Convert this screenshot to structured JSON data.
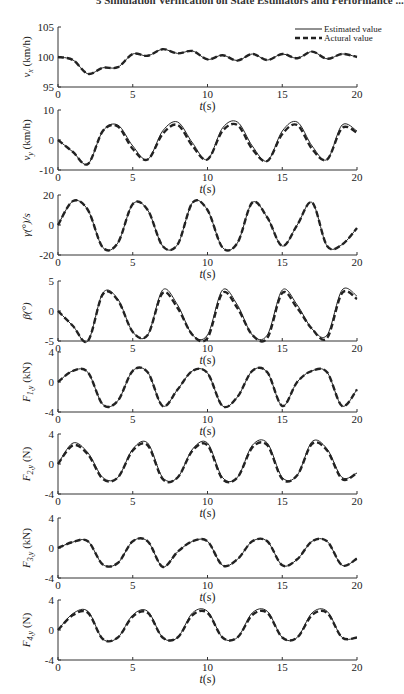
{
  "header": "5   Simulation Verification on State Estimators and Performance ...",
  "legend": [
    {
      "label": "Estimated value",
      "style": "solid"
    },
    {
      "label": "Actural value",
      "style": "dashed"
    }
  ],
  "chart_data": [
    {
      "type": "line",
      "title": "",
      "xlabel": "t(s)",
      "ylabel": "v_x (km/h)",
      "xlim": [
        0,
        20
      ],
      "ylim": [
        95,
        105
      ],
      "yticks": [
        95,
        100,
        105
      ],
      "xticks": [
        0,
        5,
        10,
        15,
        20
      ],
      "x": [
        0,
        1,
        2,
        3,
        4,
        5,
        6,
        7,
        8,
        9,
        10,
        11,
        12,
        13,
        14,
        15,
        16,
        17,
        18,
        19,
        20
      ],
      "series": [
        {
          "name": "Estimated value",
          "values": [
            100,
            99.5,
            97.2,
            98.2,
            98.3,
            100.5,
            100.2,
            101.3,
            100.6,
            101.0,
            99.6,
            100.3,
            99.4,
            100.5,
            99.5,
            100.5,
            99.8,
            100.9,
            99.7,
            100.5,
            100
          ]
        },
        {
          "name": "Actural value",
          "values": [
            100,
            99.5,
            97.2,
            98.2,
            98.3,
            100.5,
            100.2,
            101.3,
            100.6,
            101.0,
            99.6,
            100.3,
            99.4,
            100.5,
            99.5,
            100.5,
            99.8,
            100.9,
            99.7,
            100.5,
            100
          ]
        }
      ]
    },
    {
      "type": "line",
      "xlabel": "t(s)",
      "ylabel": "v_y (km/h)",
      "xlim": [
        0,
        20
      ],
      "ylim": [
        -10,
        10
      ],
      "yticks": [
        -10,
        0,
        10
      ],
      "xticks": [
        0,
        5,
        10,
        15,
        20
      ],
      "x": [
        0,
        1,
        2,
        3,
        4,
        5,
        6,
        7,
        8,
        9,
        10,
        11,
        12,
        13,
        14,
        15,
        16,
        17,
        18,
        19,
        20
      ],
      "series": [
        {
          "name": "Estimated value",
          "values": [
            0,
            -4,
            -8,
            3,
            5,
            -2,
            -6.5,
            3,
            6,
            -1,
            -6.5,
            4,
            6,
            -2,
            -7,
            3,
            6,
            -2,
            -6.5,
            5,
            3
          ]
        },
        {
          "name": "Actural value",
          "values": [
            0,
            -4,
            -8,
            3,
            4.5,
            -3,
            -6.5,
            2,
            5,
            -2,
            -6.5,
            3,
            5,
            -3,
            -7,
            2,
            5,
            -3,
            -6.5,
            4,
            2.5
          ]
        }
      ]
    },
    {
      "type": "line",
      "xlabel": "t(s)",
      "ylabel": "γ(°)/s",
      "xlim": [
        0,
        20
      ],
      "ylim": [
        -20,
        20
      ],
      "yticks": [
        -20,
        0,
        20
      ],
      "xticks": [
        0,
        5,
        10,
        15,
        20
      ],
      "x": [
        0,
        1,
        2,
        3,
        4,
        5,
        6,
        7,
        8,
        9,
        10,
        11,
        12,
        13,
        14,
        15,
        16,
        17,
        18,
        19,
        20
      ],
      "series": [
        {
          "name": "Estimated value",
          "values": [
            0,
            16,
            10,
            -15,
            -12,
            14,
            10,
            -14,
            -13,
            15,
            10,
            -15,
            -12,
            15,
            5,
            -14,
            0,
            15,
            -14,
            -13,
            -2
          ]
        },
        {
          "name": "Actural value",
          "values": [
            0,
            16,
            10,
            -15,
            -12,
            14,
            10,
            -14,
            -13,
            15,
            10,
            -15,
            -12,
            15,
            5,
            -14,
            0,
            15,
            -14,
            -13,
            -2
          ]
        }
      ]
    },
    {
      "type": "line",
      "xlabel": "t(s)",
      "ylabel": "β(°)",
      "xlim": [
        0,
        20
      ],
      "ylim": [
        -5,
        5
      ],
      "yticks": [
        -5,
        0,
        5
      ],
      "xticks": [
        0,
        5,
        10,
        15,
        20
      ],
      "x": [
        0,
        1,
        2,
        3,
        4,
        5,
        6,
        7,
        8,
        9,
        10,
        11,
        12,
        13,
        14,
        15,
        16,
        17,
        18,
        19,
        20
      ],
      "series": [
        {
          "name": "Estimated value",
          "values": [
            0,
            -2.5,
            -5,
            3,
            2,
            -3.5,
            -4,
            3.5,
            1,
            -4,
            -4,
            3.5,
            1,
            -4,
            -4,
            3.5,
            1,
            -3,
            -4,
            3.5,
            2.5
          ]
        },
        {
          "name": "Actural value",
          "values": [
            0,
            -2.5,
            -5,
            2.8,
            1.8,
            -3.5,
            -4,
            3,
            0.5,
            -4,
            -4.5,
            3,
            0.5,
            -4,
            -4.5,
            3,
            0.5,
            -3,
            -4.5,
            3,
            2
          ]
        }
      ]
    },
    {
      "type": "line",
      "xlabel": "t(s)",
      "ylabel": "F_1,y (kN)",
      "xlim": [
        0,
        20
      ],
      "ylim": [
        -4,
        4
      ],
      "yticks": [
        -4,
        0,
        4
      ],
      "xticks": [
        0,
        5,
        10,
        15,
        20
      ],
      "x": [
        0,
        1,
        2,
        3,
        4,
        5,
        6,
        7,
        8,
        9,
        10,
        11,
        12,
        13,
        14,
        15,
        16,
        17,
        18,
        19,
        20
      ],
      "series": [
        {
          "name": "Estimated value",
          "values": [
            0,
            1.5,
            1.3,
            -3,
            -2.5,
            1.5,
            1.3,
            -3.2,
            -1,
            1.5,
            1.2,
            -3.2,
            -2,
            1.5,
            1.3,
            -3.2,
            0,
            1.5,
            1.3,
            -3.2,
            -1
          ]
        },
        {
          "name": "Actural value",
          "values": [
            0,
            1.5,
            1.3,
            -3,
            -2.5,
            1.5,
            1.3,
            -3.2,
            -1,
            1.5,
            1.2,
            -3.2,
            -2,
            1.5,
            1.3,
            -3.2,
            0,
            1.5,
            1.3,
            -3.2,
            -1
          ]
        }
      ]
    },
    {
      "type": "line",
      "xlabel": "t(s)",
      "ylabel": "F_2,y (N)",
      "xlim": [
        0,
        20
      ],
      "ylim": [
        -4,
        4
      ],
      "yticks": [
        -4,
        0,
        4
      ],
      "xticks": [
        0,
        5,
        10,
        15,
        20
      ],
      "x": [
        0,
        1,
        2,
        3,
        4,
        5,
        6,
        7,
        8,
        9,
        10,
        11,
        12,
        13,
        14,
        15,
        16,
        17,
        18,
        19,
        20
      ],
      "series": [
        {
          "name": "Estimated value",
          "values": [
            0,
            2.8,
            1.5,
            -1.8,
            -1.8,
            2,
            2.8,
            -1.8,
            -1.8,
            2,
            2.8,
            -1.8,
            -1.8,
            2.5,
            2.8,
            -1.8,
            -1.5,
            3,
            2,
            -1.8,
            -1.2
          ]
        },
        {
          "name": "Actural value",
          "values": [
            0,
            2.5,
            1.3,
            -2,
            -1.8,
            1.8,
            2.5,
            -2,
            -1.8,
            1.8,
            2.5,
            -2,
            -1.8,
            2.2,
            2.5,
            -2,
            -1.5,
            2.7,
            1.8,
            -2,
            -1.2
          ]
        }
      ]
    },
    {
      "type": "line",
      "xlabel": "t(s)",
      "ylabel": "F_3,y (kN)",
      "xlim": [
        0,
        20
      ],
      "ylim": [
        -4,
        4
      ],
      "yticks": [
        -4,
        0,
        4
      ],
      "xticks": [
        0,
        5,
        10,
        15,
        20
      ],
      "x": [
        0,
        1,
        2,
        3,
        4,
        5,
        6,
        7,
        8,
        9,
        10,
        11,
        12,
        13,
        14,
        15,
        16,
        17,
        18,
        19,
        20
      ],
      "series": [
        {
          "name": "Estimated value",
          "values": [
            0,
            0.8,
            0.9,
            -2.2,
            -2,
            0.9,
            0.9,
            -2.5,
            -0.5,
            0.9,
            0.9,
            -2.3,
            -1.5,
            0.9,
            0.9,
            -2.3,
            -1.5,
            0.9,
            0.9,
            -2.3,
            -1.4
          ]
        },
        {
          "name": "Actural value",
          "values": [
            0,
            0.8,
            0.9,
            -2.2,
            -2,
            0.9,
            0.9,
            -2.5,
            -0.5,
            0.9,
            0.9,
            -2.3,
            -1.5,
            0.9,
            0.9,
            -2.3,
            -1.5,
            0.9,
            0.9,
            -2.3,
            -1.4
          ]
        }
      ]
    },
    {
      "type": "line",
      "xlabel": "t(s)",
      "ylabel": "F_4,y (N)",
      "xlim": [
        0,
        20
      ],
      "ylim": [
        -4,
        4
      ],
      "yticks": [
        -4,
        0,
        4
      ],
      "xticks": [
        0,
        5,
        10,
        15,
        20
      ],
      "x": [
        0,
        1,
        2,
        3,
        4,
        5,
        6,
        7,
        8,
        9,
        10,
        11,
        12,
        13,
        14,
        15,
        16,
        17,
        18,
        19,
        20
      ],
      "series": [
        {
          "name": "Estimated value",
          "values": [
            0,
            2.2,
            2.5,
            -1.2,
            -1,
            2,
            2.5,
            -1,
            -1,
            2.3,
            2.5,
            -1,
            -1,
            2.3,
            2.5,
            -1,
            -1,
            2.3,
            2.5,
            -1,
            -1
          ]
        },
        {
          "name": "Actural value",
          "values": [
            0,
            2,
            2.3,
            -1.2,
            -1,
            1.8,
            2.3,
            -1,
            -1,
            2,
            2.3,
            -1,
            -1,
            2,
            2.3,
            -1,
            -1,
            2,
            2.3,
            -1,
            -1
          ]
        }
      ]
    }
  ]
}
